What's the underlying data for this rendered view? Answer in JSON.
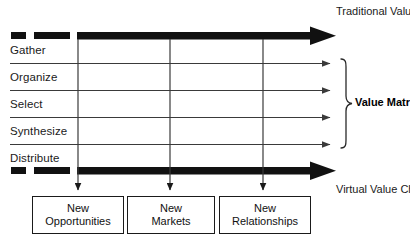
{
  "diagram": {
    "title_top": "Traditional\nValue Chain",
    "title_bottom": "Virtual\nValue Chain",
    "matrix_label": "Value\nMatrix",
    "rows": [
      {
        "label": "Gather"
      },
      {
        "label": "Organize"
      },
      {
        "label": "Select"
      },
      {
        "label": "Synthesize"
      },
      {
        "label": "Distribute"
      }
    ],
    "columns": [
      {
        "label": "New\nOpportunities"
      },
      {
        "label": "New\nMarkets"
      },
      {
        "label": "New\nRelationships"
      }
    ],
    "colors": {
      "ink": "#1a1a1a",
      "thin_line": "#4a4a4a",
      "background": "#ffffff"
    }
  }
}
